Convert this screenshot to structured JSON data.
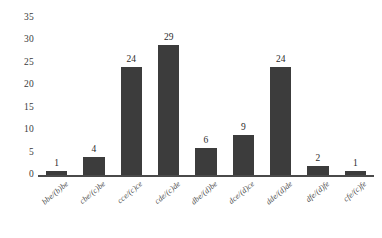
{
  "chart_data": {
    "type": "bar",
    "title": "",
    "subtitle": "",
    "xlabel": "",
    "ylabel": "",
    "categories": [
      "bbe/(b)be",
      "cbe/(c)be",
      "cce/(c)ce",
      "cde/(c)de",
      "dbe/(d)be",
      "dce/(d)ce",
      "dde/(d)de",
      "dfe/(d)fe",
      "cfe/(c)fe"
    ],
    "values": [
      1,
      4,
      24,
      29,
      6,
      9,
      24,
      2,
      1
    ],
    "value_labels": [
      "1",
      "4",
      "24",
      "29",
      "6",
      "9",
      "24",
      "2",
      "1"
    ],
    "ylim": [
      0,
      35
    ],
    "yticks": [
      0,
      5,
      10,
      15,
      20,
      25,
      30,
      35
    ],
    "ytick_labels": [
      "0",
      "5",
      "10",
      "15",
      "20",
      "25",
      "30",
      "35"
    ],
    "grid": false,
    "legend": null,
    "legend_position": "none",
    "bar_color": "#3c3c3c",
    "axis_color": "#4a4a4a",
    "text_color": "#2b2b2b",
    "background": "#ffffff",
    "xtick_rotation_deg": 40
  }
}
